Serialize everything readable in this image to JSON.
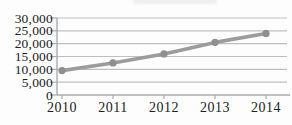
{
  "chart_data": {
    "type": "line",
    "title": "",
    "categories": [
      "2010",
      "2011",
      "2012",
      "2013",
      "2014"
    ],
    "series": [
      {
        "name": "",
        "values": [
          9500,
          12500,
          16000,
          20500,
          24000
        ]
      }
    ],
    "xlabel": "",
    "ylabel": "",
    "ylim": [
      0,
      30000
    ],
    "ytick_interval": 5000,
    "ytick_labels": [
      "0",
      "5,000",
      "10,000",
      "15,000",
      "20,000",
      "25,000",
      "30,000"
    ],
    "grid": "horizontal",
    "legend_position": "none",
    "marker": "circle",
    "style": {
      "line_color": "#9c9c9c",
      "marker_color": "#8f8f8f",
      "gridline_color": "#bfbfbf",
      "axis_color": "#ababab",
      "tick_text_color": "#222222",
      "background_color": "#fdfdfd"
    }
  }
}
